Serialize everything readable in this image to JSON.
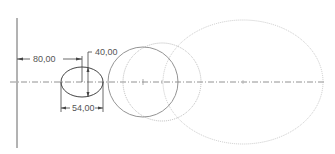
{
  "drawing": {
    "colors": {
      "background": "#ffffff",
      "geometry": "#555555",
      "construction": "#b8b8b8",
      "centerline": "#777777",
      "dimension": "#444444"
    },
    "dimensions": {
      "horizontal_offset": "80,00",
      "height": "40,00",
      "width": "54,00"
    },
    "shapes": [
      {
        "type": "ellipse",
        "name": "small-ellipse",
        "style": "solid"
      },
      {
        "type": "circle",
        "name": "solid-circle",
        "style": "solid"
      },
      {
        "type": "circle",
        "name": "dotted-circle",
        "style": "dotted"
      },
      {
        "type": "ellipse",
        "name": "large-dotted-ellipse",
        "style": "dotted"
      }
    ]
  }
}
